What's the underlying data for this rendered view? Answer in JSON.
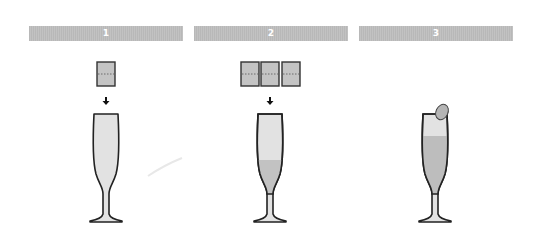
{
  "steps": [
    {
      "number": "1",
      "cubes": 1,
      "fill": "none"
    },
    {
      "number": "2",
      "cubes": 3,
      "fill": "low"
    },
    {
      "number": "3",
      "cubes": 0,
      "fill": "high",
      "garnish": "fruit-slice"
    }
  ],
  "colors": {
    "bar": "#bcbcbc",
    "glass_fill": "#e2e2e2",
    "liquid": "#bdbdbd",
    "outline": "#222222",
    "cube": "#c4c4c4"
  }
}
